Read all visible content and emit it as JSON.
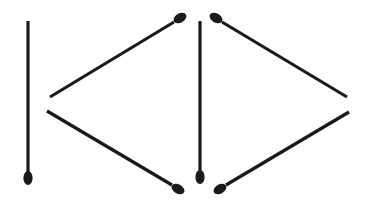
{
  "figure": {
    "stick_color": "#1a1a1a",
    "background": "#ffffff",
    "matchsticks": [
      {
        "id": "vertical-left",
        "x1": 28,
        "y1": 21,
        "x2": 28,
        "y2": 172,
        "head_x": 28,
        "head_y": 178,
        "angle": 90
      },
      {
        "id": "upper-left",
        "x1": 50,
        "y1": 97,
        "x2": 174,
        "y2": 22,
        "head_x": 180,
        "head_y": 18,
        "angle": -31
      },
      {
        "id": "lower-left",
        "x1": 47,
        "y1": 111,
        "x2": 172,
        "y2": 185,
        "head_x": 178,
        "head_y": 189,
        "angle": 31
      },
      {
        "id": "vertical-middle",
        "x1": 200,
        "y1": 21,
        "x2": 200,
        "y2": 171,
        "head_x": 200,
        "head_y": 177,
        "angle": 90
      },
      {
        "id": "upper-right",
        "x1": 222,
        "y1": 22,
        "x2": 347,
        "y2": 97,
        "head_x": 216,
        "head_y": 18,
        "angle": 31
      },
      {
        "id": "lower-right",
        "x1": 226,
        "y1": 185,
        "x2": 349,
        "y2": 112,
        "head_x": 220,
        "head_y": 189,
        "angle": -31
      }
    ]
  }
}
